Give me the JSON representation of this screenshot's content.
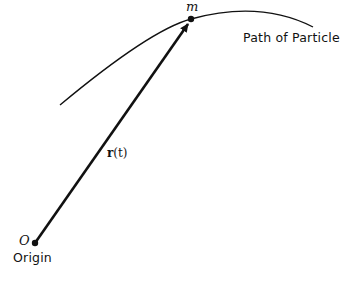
{
  "diagram": {
    "labels": {
      "mass": "m",
      "path": "Path of Particle",
      "vector_bold": "r",
      "vector_arg": "(t)",
      "origin_symbol": "O",
      "origin": "Origin"
    },
    "colors": {
      "stroke": "#111111",
      "background": "#ffffff"
    }
  }
}
